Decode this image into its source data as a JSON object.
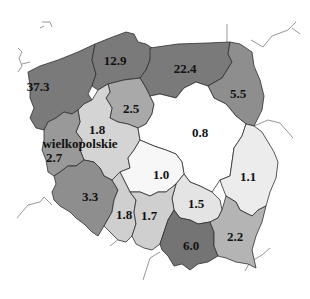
{
  "map": {
    "title": "",
    "regions": [
      {
        "id": "zachodniopomorskie",
        "value": "37.3",
        "fill": "#7a7a7a",
        "label_x": 38,
        "label_y": 86
      },
      {
        "id": "pomorskie",
        "value": "12.9",
        "fill": "#7a7a7a",
        "label_x": 115,
        "label_y": 60
      },
      {
        "id": "warminsko-mazurskie",
        "value": "22.4",
        "fill": "#7a7a7a",
        "label_x": 185,
        "label_y": 68
      },
      {
        "id": "podlaskie",
        "value": "5.5",
        "fill": "#8e8e8e",
        "label_x": 238,
        "label_y": 93
      },
      {
        "id": "kujawsko-pomorskie",
        "value": "2.5",
        "fill": "#a9a9a9",
        "label_x": 131,
        "label_y": 108
      },
      {
        "id": "wielkopolskie",
        "value": "1.8",
        "name": "wielkopolskie",
        "fill": "#d4d4d4",
        "label_x": 97,
        "label_y": 129
      },
      {
        "id": "mazowieckie",
        "value": "0.8",
        "fill": "#ffffff",
        "label_x": 200,
        "label_y": 132
      },
      {
        "id": "lubuskie",
        "value": "2.7",
        "fill": "#999999",
        "label_x": 54,
        "label_y": 156
      },
      {
        "id": "lodzkie",
        "value": "1.0",
        "fill": "#f7f7f7",
        "label_x": 161,
        "label_y": 174
      },
      {
        "id": "lubelskie",
        "value": "1.1",
        "fill": "#ececec",
        "label_x": 248,
        "label_y": 175
      },
      {
        "id": "dolnoslaskie",
        "value": "3.3",
        "fill": "#8e8e8e",
        "label_x": 90,
        "label_y": 194
      },
      {
        "id": "swietokrzyskie",
        "value": "1.5",
        "fill": "#e4e4e4",
        "label_x": 196,
        "label_y": 201
      },
      {
        "id": "opolskie",
        "value": "1.8",
        "fill": "#cfcfcf",
        "label_x": 124,
        "label_y": 213
      },
      {
        "id": "slaskie",
        "value": "1.7",
        "fill": "#cfcfcf",
        "label_x": 148,
        "label_y": 214
      },
      {
        "id": "malopolskie",
        "value": "6.0",
        "fill": "#747474",
        "label_x": 191,
        "label_y": 244
      },
      {
        "id": "podkarpackie",
        "value": "2.2",
        "fill": "#b4b4b4",
        "label_x": 235,
        "label_y": 236
      }
    ],
    "region_name_label": "wielkopolskie",
    "background": "#ffffff"
  }
}
